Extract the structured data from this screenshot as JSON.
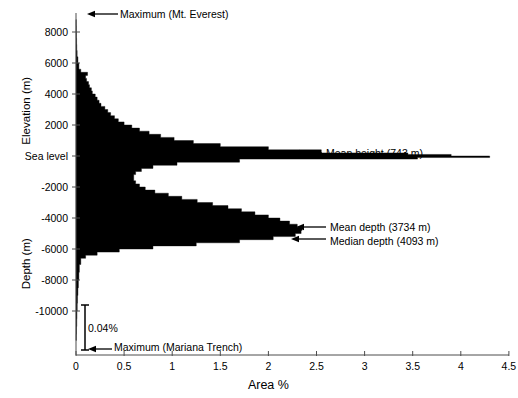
{
  "chart_data": {
    "type": "area",
    "title": "",
    "subtitle": "",
    "orientation": "horizontal",
    "xlabel": "Area %",
    "ylabel_upper": "Elevation  (m)",
    "ylabel_lower": "Depth (m)",
    "grid": false,
    "legend": null,
    "xlim": [
      0,
      4.5
    ],
    "ylim": [
      -12400,
      9000
    ],
    "xticks": [
      "0",
      "0.5",
      "1",
      "1.5",
      "2",
      "2.5",
      "3",
      "3.5",
      "4",
      "4.5"
    ],
    "xtick_values": [
      0,
      0.5,
      1,
      1.5,
      2,
      2.5,
      3,
      3.5,
      4,
      4.5
    ],
    "yticks": [
      "8000",
      "6000",
      "4000",
      "2000",
      "Sea level",
      "-2000",
      "-4000",
      "-6000",
      "-8000",
      "-10000"
    ],
    "ytick_values": [
      8000,
      6000,
      4000,
      2000,
      0,
      -2000,
      -4000,
      -6000,
      -8000,
      -10000
    ],
    "series_name": "Earth surface area distribution",
    "fill_color": "#000000",
    "elevation_m": [
      8800,
      8400,
      8000,
      7600,
      7200,
      6800,
      6400,
      6000,
      5600,
      5400,
      5200,
      5000,
      4800,
      4600,
      4400,
      4200,
      4000,
      3800,
      3600,
      3400,
      3200,
      3000,
      2800,
      2600,
      2400,
      2200,
      2000,
      1800,
      1600,
      1400,
      1200,
      1000,
      800,
      600,
      400,
      200,
      100,
      0,
      -100,
      -200,
      -400,
      -600,
      -800,
      -1000,
      -1200,
      -1400,
      -1600,
      -1800,
      -2000,
      -2200,
      -2400,
      -2600,
      -2800,
      -3000,
      -3200,
      -3400,
      -3600,
      -3800,
      -4000,
      -4200,
      -4400,
      -4600,
      -4800,
      -5000,
      -5200,
      -5400,
      -5600,
      -5800,
      -6000,
      -6200,
      -6400,
      -6600,
      -7000,
      -7500,
      -8000,
      -8500,
      -9000,
      -9500,
      -10000,
      -10500,
      -11000,
      -11500,
      -11900
    ],
    "area_percent": [
      0.002,
      0.003,
      0.004,
      0.006,
      0.008,
      0.012,
      0.02,
      0.03,
      0.05,
      0.12,
      0.1,
      0.11,
      0.13,
      0.14,
      0.16,
      0.17,
      0.2,
      0.22,
      0.24,
      0.26,
      0.3,
      0.33,
      0.36,
      0.4,
      0.44,
      0.5,
      0.58,
      0.66,
      0.76,
      0.88,
      1.02,
      1.22,
      1.5,
      2.0,
      2.55,
      3.45,
      3.9,
      4.3,
      3.55,
      1.7,
      1.05,
      0.8,
      0.68,
      0.62,
      0.6,
      0.6,
      0.62,
      0.66,
      0.72,
      0.82,
      0.96,
      1.1,
      1.26,
      1.42,
      1.58,
      1.72,
      1.86,
      2.0,
      2.12,
      2.22,
      2.3,
      2.35,
      2.34,
      2.28,
      2.05,
      1.7,
      1.25,
      0.8,
      0.45,
      0.22,
      0.1,
      0.05,
      0.035,
      0.03,
      0.025,
      0.02,
      0.016,
      0.013,
      0.01,
      0.008,
      0.005,
      0.003,
      0.001
    ],
    "annotations": [
      {
        "name": "maximum-everest",
        "label": "Maximum (Mt. Everest)",
        "arrow": "left",
        "text_x": 120,
        "text_y": 14,
        "arrow_from_x": 118,
        "arrow_to_x": 87,
        "arrow_y": 14
      },
      {
        "name": "mean-height",
        "label": "Mean height (743 m)",
        "arrow": "left",
        "text_x": 326,
        "text_y": 153,
        "arrow_from_x": 322,
        "arrow_to_x": 292,
        "arrow_y": 153
      },
      {
        "name": "mean-depth",
        "label": "Mean depth (3734 m)",
        "arrow": "left",
        "text_x": 330,
        "text_y": 227,
        "arrow_from_x": 326,
        "arrow_to_x": 296,
        "arrow_y": 227
      },
      {
        "name": "median-depth",
        "label": "Median depth (4093 m)",
        "arrow": "left",
        "text_x": 330,
        "text_y": 241,
        "arrow_from_x": 326,
        "arrow_to_x": 291,
        "arrow_y": 239
      },
      {
        "name": "maximum-mariana-trench",
        "label": "Maximum (Mariana Trench)",
        "arrow": "left",
        "text_x": 114,
        "text_y": 347,
        "arrow_from_x": 112,
        "arrow_to_x": 88,
        "arrow_y": 349
      }
    ],
    "bracket": {
      "name": "trench-area-bracket",
      "label": "0.04%",
      "x_px": 85,
      "top_px": 305,
      "bottom_px": 350,
      "label_x": 88,
      "label_y": 328,
      "depth_range_m": [
        -8000,
        -11900
      ]
    },
    "geometry": {
      "x0_px": 76,
      "x_per_percent_px": 96.2,
      "y_sea_level_px": 156,
      "y_per_2000m_px": 31.0,
      "axis_top_px": 13,
      "axis_bottom_px": 355,
      "axis_right_px": 509
    }
  }
}
